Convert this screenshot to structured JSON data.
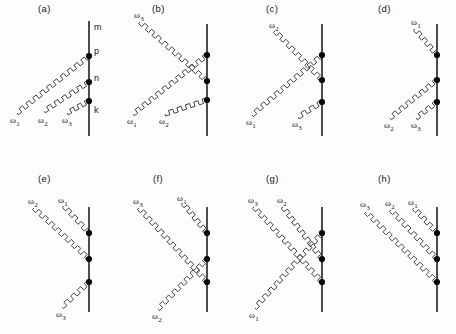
{
  "figure": {
    "title": "",
    "background_color": "#fdfdfd",
    "line_color": "#111111",
    "photon_color": "#444444",
    "vertex_color": "#080808",
    "width": 456,
    "height": 334
  },
  "symbols": {
    "omega": "ω",
    "omega_1": "ω",
    "omega_1_sub": "1",
    "omega_2_sub": "2",
    "omega_3_sub": "3"
  },
  "panels": [
    {
      "id": "a",
      "label": "(a)",
      "label_pos": [
        38,
        3
      ],
      "origin": [
        0,
        0
      ],
      "matter_line": {
        "x": 89,
        "y1": 21,
        "y2": 136
      },
      "state_labels": [
        {
          "text": "m",
          "x": 94,
          "y": 22
        },
        {
          "text": "p",
          "x": 94,
          "y": 46
        },
        {
          "text": "n",
          "x": 94,
          "y": 73
        },
        {
          "text": "k",
          "x": 94,
          "y": 105
        }
      ],
      "vertices": [
        {
          "x": 89,
          "y": 56
        },
        {
          "x": 89,
          "y": 82
        },
        {
          "x": 89,
          "y": 101
        }
      ],
      "photons": [
        {
          "name": "ω₁",
          "sub": "1",
          "from": [
            17,
            113
          ],
          "to": [
            89,
            56
          ],
          "label_x": 10,
          "label_y": 115
        },
        {
          "name": "ω₂",
          "sub": "2",
          "from": [
            44,
            111
          ],
          "to": [
            89,
            82
          ],
          "label_x": 38,
          "label_y": 115
        },
        {
          "name": "ω₃",
          "sub": "3",
          "from": [
            67,
            113
          ],
          "to": [
            89,
            101
          ],
          "label_x": 62,
          "label_y": 115
        }
      ]
    },
    {
      "id": "b",
      "label": "(b)",
      "label_pos": [
        152,
        3
      ],
      "origin": [
        0,
        0
      ],
      "matter_line": {
        "x": 207,
        "y1": 24,
        "y2": 136
      },
      "state_labels": [],
      "vertices": [
        {
          "x": 207,
          "y": 55
        },
        {
          "x": 207,
          "y": 81
        },
        {
          "x": 207,
          "y": 100
        }
      ],
      "photons": [
        {
          "name": "ω₃",
          "sub": "3",
          "from": [
            140,
            22
          ],
          "to": [
            207,
            81
          ],
          "label_x": 134,
          "label_y": 10
        },
        {
          "name": "ω₁",
          "sub": "1",
          "from": [
            133,
            114
          ],
          "to": [
            207,
            55
          ],
          "label_x": 127,
          "label_y": 116
        },
        {
          "name": "ω₂",
          "sub": "2",
          "from": [
            165,
            114
          ],
          "to": [
            207,
            100
          ],
          "label_x": 159,
          "label_y": 116
        }
      ]
    },
    {
      "id": "c",
      "label": "(c)",
      "label_pos": [
        266,
        3
      ],
      "origin": [
        0,
        0
      ],
      "matter_line": {
        "x": 322,
        "y1": 24,
        "y2": 136
      },
      "state_labels": [],
      "vertices": [
        {
          "x": 322,
          "y": 55
        },
        {
          "x": 322,
          "y": 80
        },
        {
          "x": 322,
          "y": 102
        }
      ],
      "photons": [
        {
          "name": "ω₂",
          "sub": "2",
          "from": [
            275,
            31
          ],
          "to": [
            322,
            80
          ],
          "label_x": 269,
          "label_y": 20
        },
        {
          "name": "ω₁",
          "sub": "1",
          "from": [
            252,
            115
          ],
          "to": [
            322,
            55
          ],
          "label_x": 246,
          "label_y": 117
        },
        {
          "name": "ω₃",
          "sub": "3",
          "from": [
            298,
            117
          ],
          "to": [
            322,
            102
          ],
          "label_x": 292,
          "label_y": 119
        }
      ]
    },
    {
      "id": "d",
      "label": "(d)",
      "label_pos": [
        378,
        3
      ],
      "origin": [
        0,
        0
      ],
      "matter_line": {
        "x": 437,
        "y1": 24,
        "y2": 136
      },
      "state_labels": [],
      "vertices": [
        {
          "x": 437,
          "y": 55
        },
        {
          "x": 437,
          "y": 80
        },
        {
          "x": 437,
          "y": 102
        }
      ],
      "photons": [
        {
          "name": "ω₁",
          "sub": "1",
          "from": [
            415,
            29
          ],
          "to": [
            437,
            55
          ],
          "label_x": 411,
          "label_y": 17
        },
        {
          "name": "ω₂",
          "sub": "2",
          "from": [
            390,
            118
          ],
          "to": [
            437,
            80
          ],
          "label_x": 384,
          "label_y": 120
        },
        {
          "name": "ω₃",
          "sub": "3",
          "from": [
            416,
            118
          ],
          "to": [
            437,
            102
          ],
          "label_x": 411,
          "label_y": 120
        }
      ]
    },
    {
      "id": "e",
      "label": "(e)",
      "label_pos": [
        38,
        173
      ],
      "origin": [
        0,
        0
      ],
      "matter_line": {
        "x": 89,
        "y1": 207,
        "y2": 312
      },
      "state_labels": [],
      "vertices": [
        {
          "x": 89,
          "y": 233
        },
        {
          "x": 89,
          "y": 259
        },
        {
          "x": 89,
          "y": 282
        }
      ],
      "photons": [
        {
          "name": "ω₂",
          "sub": "2",
          "from": [
            34,
            208
          ],
          "to": [
            89,
            259
          ],
          "label_x": 28,
          "label_y": 196
        },
        {
          "name": "ω₁",
          "sub": "1",
          "from": [
            64,
            206
          ],
          "to": [
            89,
            233
          ],
          "label_x": 58,
          "label_y": 195
        },
        {
          "name": "ω₃",
          "sub": "3",
          "from": [
            62,
            307
          ],
          "to": [
            89,
            282
          ],
          "label_x": 56,
          "label_y": 309
        }
      ]
    },
    {
      "id": "f",
      "label": "(f)",
      "label_pos": [
        153,
        173
      ],
      "origin": [
        0,
        0
      ],
      "matter_line": {
        "x": 207,
        "y1": 207,
        "y2": 312
      },
      "state_labels": [],
      "vertices": [
        {
          "x": 207,
          "y": 233
        },
        {
          "x": 207,
          "y": 259
        },
        {
          "x": 207,
          "y": 282
        }
      ],
      "photons": [
        {
          "name": "ω₃",
          "sub": "3",
          "from": [
            139,
            208
          ],
          "to": [
            207,
            282
          ],
          "label_x": 133,
          "label_y": 196
        },
        {
          "name": "ω₁",
          "sub": "1",
          "from": [
            183,
            203
          ],
          "to": [
            207,
            233
          ],
          "label_x": 177,
          "label_y": 193
        },
        {
          "name": "ω₂",
          "sub": "2",
          "from": [
            158,
            309
          ],
          "to": [
            207,
            259
          ],
          "label_x": 152,
          "label_y": 311
        }
      ]
    },
    {
      "id": "g",
      "label": "(g)",
      "label_pos": [
        266,
        173
      ],
      "origin": [
        0,
        0
      ],
      "matter_line": {
        "x": 322,
        "y1": 207,
        "y2": 312
      },
      "state_labels": [],
      "vertices": [
        {
          "x": 322,
          "y": 233
        },
        {
          "x": 322,
          "y": 259
        },
        {
          "x": 322,
          "y": 282
        }
      ],
      "photons": [
        {
          "name": "ω₃",
          "sub": "3",
          "from": [
            254,
            207
          ],
          "to": [
            322,
            282
          ],
          "label_x": 248,
          "label_y": 195
        },
        {
          "name": "ω₂",
          "sub": "2",
          "from": [
            283,
            207
          ],
          "to": [
            322,
            259
          ],
          "label_x": 277,
          "label_y": 195
        },
        {
          "name": "ω₁",
          "sub": "1",
          "from": [
            255,
            308
          ],
          "to": [
            322,
            233
          ],
          "label_x": 249,
          "label_y": 310
        }
      ]
    },
    {
      "id": "h",
      "label": "(h)",
      "label_pos": [
        378,
        173
      ],
      "origin": [
        0,
        0
      ],
      "matter_line": {
        "x": 437,
        "y1": 207,
        "y2": 312
      },
      "state_labels": [],
      "vertices": [
        {
          "x": 437,
          "y": 233
        },
        {
          "x": 437,
          "y": 259
        },
        {
          "x": 437,
          "y": 282
        }
      ],
      "photons": [
        {
          "name": "ω₃",
          "sub": "3",
          "from": [
            366,
            212
          ],
          "to": [
            437,
            282
          ],
          "label_x": 360,
          "label_y": 199
        },
        {
          "name": "ω₂",
          "sub": "2",
          "from": [
            391,
            210
          ],
          "to": [
            437,
            259
          ],
          "label_x": 385,
          "label_y": 198
        },
        {
          "name": "ω₁",
          "sub": "1",
          "from": [
            414,
            208
          ],
          "to": [
            437,
            233
          ],
          "label_x": 408,
          "label_y": 197
        }
      ]
    }
  ]
}
